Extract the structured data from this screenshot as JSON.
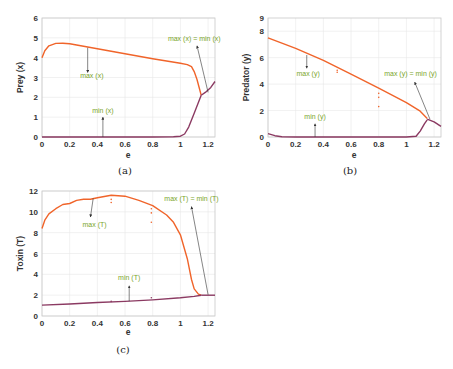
{
  "captions": {
    "a": "(a)",
    "b": "(b)",
    "c": "(c)"
  },
  "colors": {
    "max_line": "#f0642a",
    "min_line": "#8b3a62",
    "annotation_text": "#7aa52a",
    "arrow": "#333333",
    "grid": "#e8e8e8",
    "frame": "#c8c8c8"
  },
  "chart_data": [
    {
      "id": "a",
      "type": "line",
      "title": "",
      "xlabel": "e",
      "ylabel": "Prey (x)",
      "xlim": [
        0,
        1.25
      ],
      "ylim": [
        0,
        6
      ],
      "xticks": [
        0,
        0.2,
        0.4,
        0.6,
        0.8,
        1,
        1.2
      ],
      "xtick_labels": [
        "0",
        "0.2",
        "0.4",
        "0.6",
        "0.8",
        "1",
        "1.2"
      ],
      "yticks": [
        0,
        1,
        2,
        3,
        4,
        5,
        6
      ],
      "ytick_labels": [
        "0",
        "1",
        "2",
        "3",
        "4",
        "5",
        "6"
      ],
      "grid": true,
      "series": [
        {
          "name": "max (x)",
          "color": "#f0642a",
          "x": [
            0,
            0.02,
            0.05,
            0.1,
            0.15,
            0.2,
            0.4,
            0.6,
            0.8,
            1.0,
            1.05,
            1.08,
            1.1,
            1.12,
            1.15
          ],
          "y": [
            4.0,
            4.35,
            4.6,
            4.72,
            4.73,
            4.7,
            4.45,
            4.2,
            3.95,
            3.72,
            3.65,
            3.55,
            3.3,
            2.9,
            2.1
          ]
        },
        {
          "name": "min (x)",
          "color": "#8b3a62",
          "x": [
            0,
            0.2,
            0.4,
            0.6,
            0.8,
            0.95,
            1.0,
            1.03,
            1.06,
            1.1,
            1.15
          ],
          "y": [
            0,
            0,
            0,
            0,
            0,
            0.01,
            0.04,
            0.15,
            0.5,
            1.2,
            2.1
          ]
        },
        {
          "name": "max (x) = min (x)",
          "color": "#8b3a62",
          "x": [
            1.15,
            1.18,
            1.22,
            1.25
          ],
          "y": [
            2.1,
            2.25,
            2.5,
            2.8
          ]
        }
      ],
      "annotations": [
        {
          "text": "max (x)",
          "x": 0.36,
          "y": 2.95,
          "arrow_from": [
            0.33,
            4.5
          ],
          "arrow_to": [
            0.33,
            3.25
          ]
        },
        {
          "text": "min (x)",
          "x": 0.44,
          "y": 1.2,
          "arrow_from": [
            0.44,
            0.0
          ],
          "arrow_to": [
            0.44,
            1.0
          ]
        },
        {
          "text": "max (x) = min (x)",
          "x": 1.1,
          "y": 4.85,
          "arrow_from": [
            1.2,
            2.25
          ],
          "arrow_to": [
            1.12,
            4.6
          ]
        }
      ]
    },
    {
      "id": "b",
      "type": "line",
      "title": "",
      "xlabel": "e",
      "ylabel": "Predator (y)",
      "xlim": [
        0,
        1.25
      ],
      "ylim": [
        0,
        9
      ],
      "xticks": [
        0,
        0.2,
        0.4,
        0.6,
        0.8,
        1,
        1.2
      ],
      "xtick_labels": [
        "0",
        "0.2",
        "0.4",
        "0.6",
        "0.8",
        "1",
        "1.2"
      ],
      "yticks": [
        0,
        2,
        4,
        6,
        8
      ],
      "ytick_labels": [
        "0",
        "2",
        "4",
        "6",
        "8"
      ],
      "ytick_top": "9",
      "grid": true,
      "series": [
        {
          "name": "max (y)",
          "color": "#f0642a",
          "x": [
            0,
            0.2,
            0.4,
            0.6,
            0.8,
            1.0,
            1.1,
            1.15
          ],
          "y": [
            7.5,
            6.7,
            5.8,
            4.75,
            3.7,
            2.6,
            1.95,
            1.4
          ]
        },
        {
          "name": "min (y)",
          "color": "#8b3a62",
          "x": [
            0,
            0.05,
            0.1,
            0.2,
            0.6,
            1.0,
            1.07,
            1.1,
            1.13,
            1.15
          ],
          "y": [
            0.25,
            0.1,
            0.02,
            0,
            0,
            0,
            0.05,
            0.45,
            1.0,
            1.3
          ]
        },
        {
          "name": "max (y) = min (y)",
          "color": "#8b3a62",
          "x": [
            1.15,
            1.2,
            1.25
          ],
          "y": [
            1.35,
            1.15,
            0.8
          ]
        }
      ],
      "scatter_points": [
        {
          "x": 0.5,
          "y": 5.05,
          "color": "#f0642a"
        },
        {
          "x": 0.5,
          "y": 4.9,
          "color": "#f0642a"
        },
        {
          "x": 0.8,
          "y": 3.3,
          "color": "#f0642a"
        },
        {
          "x": 0.8,
          "y": 3.0,
          "color": "#f0642a"
        },
        {
          "x": 0.8,
          "y": 2.3,
          "color": "#f0642a"
        }
      ],
      "annotations": [
        {
          "text": "max (y)",
          "x": 0.29,
          "y": 4.6,
          "arrow_from": [
            0.28,
            6.2
          ],
          "arrow_to": [
            0.28,
            5.2
          ]
        },
        {
          "text": "min (y)",
          "x": 0.34,
          "y": 1.35,
          "arrow_from": [
            0.34,
            0.0
          ],
          "arrow_to": [
            0.34,
            1.0
          ]
        },
        {
          "text": "max (y) = min (y)",
          "x": 1.03,
          "y": 4.6,
          "arrow_from": [
            1.17,
            1.35
          ],
          "arrow_to": [
            1.06,
            4.15
          ]
        }
      ]
    },
    {
      "id": "c",
      "type": "line",
      "title": "",
      "xlabel": "e",
      "ylabel": "Toxin (T)",
      "xlim": [
        0,
        1.25
      ],
      "ylim": [
        0,
        12
      ],
      "xticks": [
        0,
        0.2,
        0.4,
        0.6,
        0.8,
        1,
        1.2
      ],
      "xtick_labels": [
        "0",
        "0.2",
        "0.4",
        "0.6",
        "0.8",
        "1",
        "1.2"
      ],
      "yticks": [
        0,
        2,
        4,
        6,
        8,
        10,
        12
      ],
      "ytick_labels": [
        "0",
        "2",
        "4",
        "6",
        "8",
        "10",
        "12"
      ],
      "grid": true,
      "series": [
        {
          "name": "max (T)",
          "color": "#f0642a",
          "x": [
            0,
            0.02,
            0.05,
            0.1,
            0.15,
            0.2,
            0.25,
            0.3,
            0.35,
            0.4,
            0.5,
            0.6,
            0.7,
            0.8,
            0.9,
            0.95,
            1.0,
            1.05,
            1.08,
            1.1,
            1.13,
            1.15
          ],
          "y": [
            8.4,
            9.2,
            9.8,
            10.3,
            10.7,
            10.8,
            11.1,
            11.2,
            11.2,
            11.35,
            11.6,
            11.5,
            11.1,
            10.6,
            9.7,
            9.0,
            7.8,
            5.5,
            3.5,
            2.6,
            2.1,
            2.0
          ]
        },
        {
          "name": "min (T)",
          "color": "#8b3a62",
          "x": [
            0,
            0.2,
            0.4,
            0.6,
            0.8,
            1.0,
            1.1,
            1.15
          ],
          "y": [
            1.05,
            1.15,
            1.3,
            1.4,
            1.55,
            1.75,
            1.88,
            2.0
          ]
        },
        {
          "name": "max (T) = min (T)",
          "color": "#8b3a62",
          "x": [
            1.15,
            1.2,
            1.25
          ],
          "y": [
            2.0,
            2.0,
            2.0
          ]
        }
      ],
      "scatter_points": [
        {
          "x": 0.5,
          "y": 11.2,
          "color": "#f0642a"
        },
        {
          "x": 0.5,
          "y": 10.9,
          "color": "#f0642a"
        },
        {
          "x": 0.79,
          "y": 10.3,
          "color": "#f0642a"
        },
        {
          "x": 0.79,
          "y": 9.9,
          "color": "#f0642a"
        },
        {
          "x": 0.79,
          "y": 9.0,
          "color": "#f0642a"
        },
        {
          "x": 0.5,
          "y": 1.4,
          "color": "#8b3a62"
        },
        {
          "x": 0.79,
          "y": 1.75,
          "color": "#8b3a62"
        }
      ],
      "annotations": [
        {
          "text": "max (T)",
          "x": 0.38,
          "y": 8.5,
          "arrow_from": [
            0.37,
            11.3
          ],
          "arrow_to": [
            0.35,
            9.5
          ]
        },
        {
          "text": "min (T)",
          "x": 0.63,
          "y": 3.5,
          "arrow_from": [
            0.63,
            1.42
          ],
          "arrow_to": [
            0.63,
            2.9
          ]
        },
        {
          "text": "max (T) = min (T)",
          "x": 1.08,
          "y": 11.0,
          "arrow_from": [
            1.2,
            2.05
          ],
          "arrow_to": [
            1.08,
            10.5
          ]
        }
      ]
    }
  ]
}
